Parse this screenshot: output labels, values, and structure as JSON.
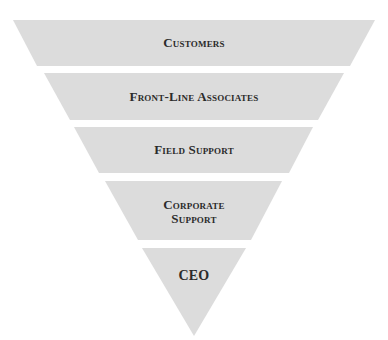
{
  "diagram": {
    "fill_color": "#dcdcdc",
    "text_color": "#2b2b2b",
    "background": "#ffffff",
    "levels": [
      {
        "label": "Customers",
        "order": 1
      },
      {
        "label": "Front-Line Associates",
        "order": 2
      },
      {
        "label": "Field Support",
        "order": 3
      },
      {
        "label": "Corporate Support",
        "line1": "Corporate",
        "line2": "Support",
        "order": 4
      },
      {
        "label": "CEO",
        "order": 5
      }
    ]
  }
}
